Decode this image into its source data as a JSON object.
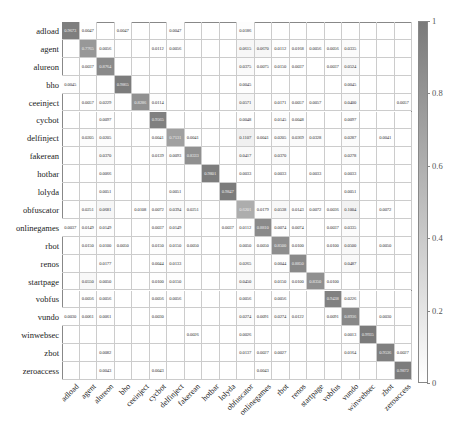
{
  "chart_data": {
    "type": "heatmap",
    "title": "",
    "xlabel": "",
    "ylabel": "",
    "labels": [
      "adload",
      "agent",
      "alureon",
      "bho",
      "ceeinject",
      "cycbot",
      "delfinject",
      "fakerean",
      "hotbar",
      "lolyda",
      "obfuscator",
      "onlinegames",
      "rbot",
      "renos",
      "startpage",
      "vobfus",
      "vundo",
      "winwebsec",
      "zbot",
      "zeroaccess"
    ],
    "rows": [
      "adload",
      "agent",
      "alureon",
      "bho",
      "ceeinject",
      "cycbot",
      "delfinject",
      "fakerean",
      "hotbar",
      "lolyda",
      "obfuscator",
      "onlinegames",
      "rbot",
      "renos",
      "startpage",
      "vobfus",
      "vundo",
      "winwebsec",
      "zbot",
      "zeroaccess"
    ],
    "cells": [
      [
        0,
        0,
        0.9673
      ],
      [
        0,
        1,
        0.0047
      ],
      [
        0,
        3,
        0.0047
      ],
      [
        0,
        6,
        0.0047
      ],
      [
        0,
        10,
        0.0186
      ],
      [
        1,
        1,
        0.7765
      ],
      [
        1,
        2,
        0.0056
      ],
      [
        1,
        5,
        0.0112
      ],
      [
        1,
        6,
        0.0056
      ],
      [
        1,
        10,
        0.0615
      ],
      [
        1,
        11,
        0.067
      ],
      [
        1,
        12,
        0.0112
      ],
      [
        1,
        13,
        0.0168
      ],
      [
        1,
        14,
        0.0056
      ],
      [
        1,
        15,
        0.0056
      ],
      [
        1,
        16,
        0.0335
      ],
      [
        2,
        1,
        0.0037
      ],
      [
        2,
        2,
        0.8764
      ],
      [
        2,
        10,
        0.0375
      ],
      [
        2,
        11,
        0.0075
      ],
      [
        2,
        12,
        0.015
      ],
      [
        2,
        13,
        0.0037
      ],
      [
        2,
        15,
        0.0037
      ],
      [
        2,
        16,
        0.0524
      ],
      [
        3,
        0,
        0.0045
      ],
      [
        3,
        3,
        0.9865
      ],
      [
        3,
        10,
        0.0045
      ],
      [
        3,
        16,
        0.0045
      ],
      [
        4,
        1,
        0.0057
      ],
      [
        4,
        2,
        0.0229
      ],
      [
        4,
        4,
        0.8286
      ],
      [
        4,
        5,
        0.0114
      ],
      [
        4,
        10,
        0.0571
      ],
      [
        4,
        12,
        0.0171
      ],
      [
        4,
        13,
        0.0057
      ],
      [
        4,
        14,
        0.0057
      ],
      [
        4,
        16,
        0.04
      ],
      [
        4,
        19,
        0.0057
      ],
      [
        5,
        2,
        0.0097
      ],
      [
        5,
        5,
        0.9565
      ],
      [
        5,
        10,
        0.0048
      ],
      [
        5,
        12,
        0.0145
      ],
      [
        5,
        13,
        0.0048
      ],
      [
        5,
        16,
        0.0097
      ],
      [
        6,
        1,
        0.0205
      ],
      [
        6,
        2,
        0.0205
      ],
      [
        6,
        5,
        0.0041
      ],
      [
        6,
        6,
        0.7131
      ],
      [
        6,
        7,
        0.0041
      ],
      [
        6,
        10,
        0.1107
      ],
      [
        6,
        11,
        0.0041
      ],
      [
        6,
        12,
        0.0205
      ],
      [
        6,
        13,
        0.0369
      ],
      [
        6,
        14,
        0.0328
      ],
      [
        6,
        16,
        0.0287
      ],
      [
        6,
        18,
        0.0041
      ],
      [
        7,
        2,
        0.037
      ],
      [
        7,
        5,
        0.0139
      ],
      [
        7,
        6,
        0.0093
      ],
      [
        7,
        7,
        0.8333
      ],
      [
        7,
        10,
        0.0417
      ],
      [
        7,
        12,
        0.037
      ],
      [
        7,
        16,
        0.0278
      ],
      [
        8,
        2,
        0.0066
      ],
      [
        8,
        8,
        0.9801
      ],
      [
        8,
        10,
        0.0033
      ],
      [
        8,
        12,
        0.0033
      ],
      [
        8,
        14,
        0.0033
      ],
      [
        8,
        16,
        0.0033
      ],
      [
        9,
        2,
        0.0051
      ],
      [
        9,
        6,
        0.0051
      ],
      [
        9,
        9,
        0.9847
      ],
      [
        9,
        16,
        0.0051
      ],
      [
        10,
        1,
        0.0251
      ],
      [
        10,
        2,
        0.0681
      ],
      [
        10,
        4,
        0.0108
      ],
      [
        10,
        5,
        0.0072
      ],
      [
        10,
        6,
        0.0394
      ],
      [
        10,
        7,
        0.0251
      ],
      [
        10,
        10,
        0.6201
      ],
      [
        10,
        11,
        0.0179
      ],
      [
        10,
        12,
        0.0538
      ],
      [
        10,
        13,
        0.0143
      ],
      [
        10,
        14,
        0.0072
      ],
      [
        10,
        15,
        0.0036
      ],
      [
        10,
        16,
        0.1004
      ],
      [
        10,
        18,
        0.0072
      ],
      [
        11,
        0,
        0.0037
      ],
      [
        11,
        1,
        0.0149
      ],
      [
        11,
        2,
        0.0149
      ],
      [
        11,
        5,
        0.0037
      ],
      [
        11,
        6,
        0.0149
      ],
      [
        11,
        9,
        0.0037
      ],
      [
        11,
        10,
        0.0112
      ],
      [
        11,
        11,
        0.881
      ],
      [
        11,
        12,
        0.0074
      ],
      [
        11,
        13,
        0.0074
      ],
      [
        11,
        15,
        0.0037
      ],
      [
        11,
        16,
        0.0335
      ],
      [
        12,
        1,
        0.015
      ],
      [
        12,
        2,
        0.01
      ],
      [
        12,
        3,
        0.005
      ],
      [
        12,
        5,
        0.015
      ],
      [
        12,
        6,
        0.015
      ],
      [
        12,
        7,
        0.005
      ],
      [
        12,
        10,
        0.005
      ],
      [
        12,
        11,
        0.005
      ],
      [
        12,
        12,
        0.85
      ],
      [
        12,
        13,
        0.01
      ],
      [
        12,
        15,
        0.01
      ],
      [
        12,
        16,
        0.05
      ],
      [
        12,
        18,
        0.005
      ],
      [
        13,
        2,
        0.0177
      ],
      [
        13,
        5,
        0.0044
      ],
      [
        13,
        6,
        0.0133
      ],
      [
        13,
        10,
        0.0265
      ],
      [
        13,
        12,
        0.0044
      ],
      [
        13,
        13,
        0.885
      ],
      [
        13,
        16,
        0.0487
      ],
      [
        14,
        1,
        0.055
      ],
      [
        14,
        2,
        0.005
      ],
      [
        14,
        5,
        0.01
      ],
      [
        14,
        6,
        0.015
      ],
      [
        14,
        10,
        0.045
      ],
      [
        14,
        12,
        0.015
      ],
      [
        14,
        13,
        0.01
      ],
      [
        14,
        14,
        0.835
      ],
      [
        14,
        15,
        0.01
      ],
      [
        15,
        1,
        0.0056
      ],
      [
        15,
        2,
        0.0056
      ],
      [
        15,
        5,
        0.0056
      ],
      [
        15,
        6,
        0.0056
      ],
      [
        15,
        10,
        0.0056
      ],
      [
        15,
        12,
        0.0056
      ],
      [
        15,
        15,
        0.9438
      ],
      [
        15,
        16,
        0.0226
      ],
      [
        16,
        0,
        0.003
      ],
      [
        16,
        1,
        0.0061
      ],
      [
        16,
        2,
        0.0061
      ],
      [
        16,
        5,
        0.003
      ],
      [
        16,
        10,
        0.0274
      ],
      [
        16,
        11,
        0.0091
      ],
      [
        16,
        12,
        0.0274
      ],
      [
        16,
        13,
        0.0122
      ],
      [
        16,
        15,
        0.0091
      ],
      [
        16,
        16,
        0.8936
      ],
      [
        16,
        18,
        0.003
      ],
      [
        17,
        7,
        0.0026
      ],
      [
        17,
        10,
        0.0026
      ],
      [
        17,
        16,
        0.0013
      ],
      [
        17,
        17,
        0.9935
      ],
      [
        18,
        2,
        0.0082
      ],
      [
        18,
        10,
        0.0137
      ],
      [
        18,
        11,
        0.0027
      ],
      [
        18,
        12,
        0.0027
      ],
      [
        18,
        16,
        0.0164
      ],
      [
        18,
        18,
        0.9536
      ],
      [
        18,
        19,
        0.0027
      ],
      [
        19,
        2,
        0.0043
      ],
      [
        19,
        5,
        0.0043
      ],
      [
        19,
        11,
        0.0043
      ],
      [
        19,
        19,
        0.9872
      ]
    ],
    "colorbar": {
      "min": 0,
      "max": 1,
      "ticks": [
        "0",
        "0.2",
        "0.4",
        "0.6",
        "0.8",
        "1"
      ],
      "low_color": "#ffffff",
      "high_color": "#7a7a7a"
    },
    "grid": true,
    "legend": "colorbar-right"
  }
}
